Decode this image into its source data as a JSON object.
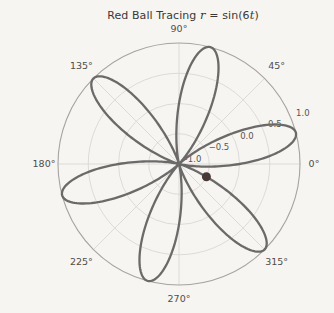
{
  "title": {
    "prefix": "Red Ball Tracing ",
    "var_r": "r",
    "mid": " = sin(6",
    "var_t": "t",
    "suffix": ")"
  },
  "colors": {
    "background": "#f6f5f2",
    "curve": "#6c6a68",
    "ball": "#483a36",
    "grid": "#d6d4d1",
    "outer_ring": "#a6a3a0",
    "theta_labels": "#4f4d4b",
    "r_labels": "#565452",
    "title": "#3a3836"
  },
  "chart_data": {
    "type": "line",
    "subtype": "polar-rose",
    "title": "Red Ball Tracing r = sin(6t)",
    "function": "r = sin(6t)",
    "petals": 6,
    "theta_range_deg": [
      0,
      360
    ],
    "rlim": [
      -1,
      1
    ],
    "grid": true,
    "rlabel_position_deg": 22.5,
    "theta_ticks_deg": [
      0,
      45,
      90,
      135,
      180,
      225,
      270,
      315
    ],
    "theta_tick_labels": [
      "0°",
      "45°",
      "90°",
      "135°",
      "180°",
      "225°",
      "270°",
      "315°"
    ],
    "r_ticks": [
      -1.0,
      -0.5,
      0.0,
      0.5,
      1.0
    ],
    "r_tick_labels": [
      "−1.0",
      "−0.5",
      "0.0",
      "0.5",
      "1.0"
    ],
    "sample_theta_deg": [
      0,
      15,
      30,
      45,
      60,
      75,
      90,
      105,
      120,
      135,
      150,
      165,
      180,
      195,
      210,
      225,
      240,
      255,
      270,
      285,
      300,
      315,
      330,
      345,
      360
    ],
    "sample_r": [
      0,
      1,
      0,
      -1,
      0,
      1,
      0,
      -1,
      0,
      1,
      0,
      -1,
      0,
      1,
      0,
      -1,
      0,
      1,
      0,
      -1,
      0,
      1,
      0,
      -1,
      0
    ],
    "ball": {
      "theta_deg": 335,
      "r": -0.5
    }
  }
}
